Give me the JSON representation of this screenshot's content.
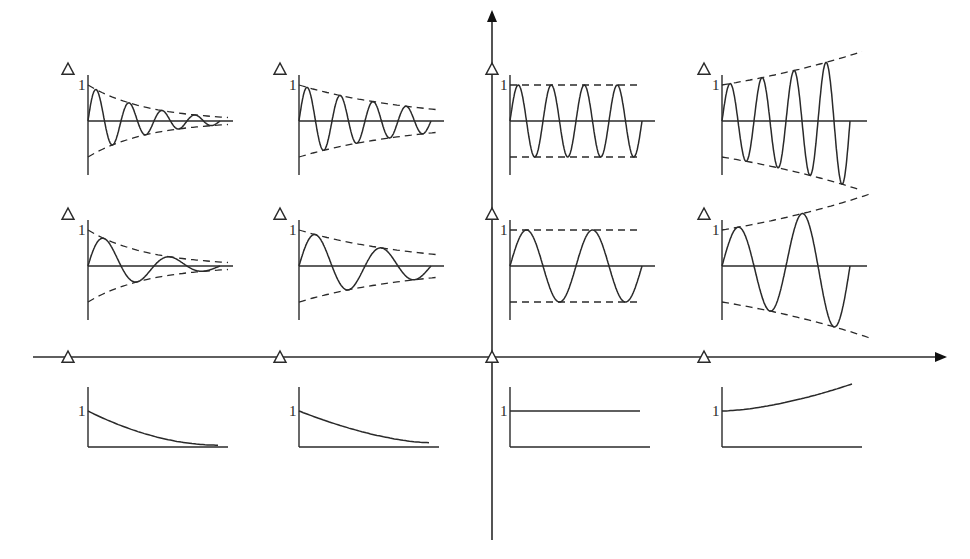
{
  "diagram": {
    "main_axes": {
      "horizontal": {
        "x_start": 33,
        "x_end": 945,
        "y": 357,
        "arrow": "right"
      },
      "vertical": {
        "x": 492,
        "y_start": 540,
        "y_end": 12,
        "arrow": "up"
      }
    },
    "root_markers_real_axis": [
      68,
      280,
      492,
      704
    ],
    "marker_symbol": "Δ",
    "unit_label": "1",
    "columns": [
      {
        "id": "col1",
        "behavior": "fast-decaying",
        "x0": 88
      },
      {
        "id": "col2",
        "behavior": "slow-decaying",
        "x0": 299
      },
      {
        "id": "col3",
        "behavior": "constant amplitude",
        "x0": 510
      },
      {
        "id": "col4",
        "behavior": "growing",
        "x0": 722
      }
    ],
    "rows": [
      {
        "id": "row1",
        "type": "oscillatory high-frequency",
        "y0": 121,
        "amp": 36,
        "cycles": 4
      },
      {
        "id": "row2",
        "type": "oscillatory low-frequency",
        "y0": 266,
        "amp": 36,
        "cycles": 2
      },
      {
        "id": "row3",
        "type": "non-oscillatory",
        "y_base": 447,
        "y_one": 411
      }
    ],
    "subplot_markers": [
      {
        "row": 1,
        "x": 68,
        "y": 70
      },
      {
        "row": 1,
        "x": 280,
        "y": 70
      },
      {
        "row": 1,
        "x": 492,
        "y": 70
      },
      {
        "row": 1,
        "x": 704,
        "y": 70
      },
      {
        "row": 2,
        "x": 68,
        "y": 215
      },
      {
        "row": 2,
        "x": 280,
        "y": 215
      },
      {
        "row": 2,
        "x": 492,
        "y": 215
      },
      {
        "row": 2,
        "x": 704,
        "y": 215
      }
    ]
  }
}
